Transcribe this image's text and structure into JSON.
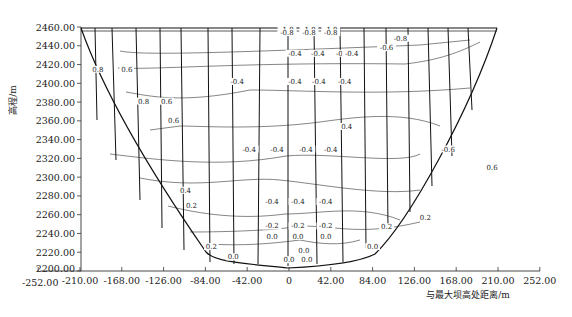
{
  "chart_data": {
    "type": "contour",
    "title": "",
    "xlabel": "与最大坝高处距离/m",
    "ylabel": "高程/m",
    "xlim": [
      -252,
      252
    ],
    "ylim": [
      2200,
      2460
    ],
    "x_ticks": [
      "-252.00",
      "-210.00",
      "-168.00",
      "-126.00",
      "-84.00",
      "-42.00",
      "0",
      "42.00",
      "84.00",
      "126.00",
      "168.00",
      "210.00",
      "252.00"
    ],
    "x_tick_values": [
      -252,
      -210,
      -168,
      -126,
      -84,
      -42,
      0,
      42,
      84,
      126,
      168,
      210,
      252
    ],
    "y_ticks": [
      "2200.00",
      "2220.00",
      "2240.00",
      "2260.00",
      "2280.00",
      "2300.00",
      "2320.00",
      "2340.00",
      "2360.00",
      "2380.00",
      "2400.00",
      "2420.00",
      "2440.00",
      "2460.00"
    ],
    "y_tick_values": [
      2200,
      2220,
      2240,
      2260,
      2280,
      2300,
      2320,
      2340,
      2360,
      2380,
      2400,
      2420,
      2440,
      2460
    ],
    "grid": false,
    "legend": null,
    "dam_outline": [
      [
        -210,
        2458
      ],
      [
        -84,
        2221
      ],
      [
        -42,
        2215
      ],
      [
        0,
        2211
      ],
      [
        42,
        2213
      ],
      [
        84,
        2221
      ],
      [
        210,
        2458
      ]
    ],
    "contour_levels": [
      -1.0,
      -0.8,
      -0.6,
      -0.4,
      -0.2,
      0.0,
      0.2,
      0.4,
      0.6,
      0.8
    ],
    "contour_labels": [
      {
        "text": "-1.0",
        "x": -2,
        "y": 2457
      },
      {
        "text": "-0.8",
        "x": -2,
        "y": 2454
      },
      {
        "text": "-1.0",
        "x": 20,
        "y": 2457
      },
      {
        "text": "-0.8",
        "x": 20,
        "y": 2454
      },
      {
        "text": "-1.0",
        "x": 42,
        "y": 2457
      },
      {
        "text": "-0.8",
        "x": 42,
        "y": 2454
      },
      {
        "text": "-0.6",
        "x": 98,
        "y": 2438
      },
      {
        "text": "-0.8",
        "x": 112,
        "y": 2448
      },
      {
        "text": "-0.4",
        "x": 6,
        "y": 2432
      },
      {
        "text": "-0.4",
        "x": 29,
        "y": 2432
      },
      {
        "text": "-0.4",
        "x": 54,
        "y": 2432
      },
      {
        "text": "-0.4",
        "x": 63,
        "y": 2432
      },
      {
        "text": "-0.4",
        "x": -52,
        "y": 2402
      },
      {
        "text": "-0.4",
        "x": 6,
        "y": 2402
      },
      {
        "text": "-0.4",
        "x": 30,
        "y": 2402
      },
      {
        "text": "-0.4",
        "x": 56,
        "y": 2402
      },
      {
        "text": "0.8",
        "x": -192,
        "y": 2415
      },
      {
        "text": "0.6",
        "x": -163,
        "y": 2415
      },
      {
        "text": "0.6",
        "x": -123,
        "y": 2381
      },
      {
        "text": "0.8",
        "x": -146,
        "y": 2381
      },
      {
        "text": "0.6",
        "x": -116,
        "y": 2360
      },
      {
        "text": "-0.4",
        "x": -40,
        "y": 2330
      },
      {
        "text": "-0.4",
        "x": -12,
        "y": 2330
      },
      {
        "text": "-0.4",
        "x": 17,
        "y": 2330
      },
      {
        "text": "-0.4",
        "x": 42,
        "y": 2330
      },
      {
        "text": "0.4",
        "x": 58,
        "y": 2354
      },
      {
        "text": "-0.6",
        "x": 160,
        "y": 2330
      },
      {
        "text": "0.6",
        "x": 204,
        "y": 2310
      },
      {
        "text": "0.4",
        "x": -104,
        "y": 2286
      },
      {
        "text": "0.2",
        "x": -98,
        "y": 2270
      },
      {
        "text": "-0.4",
        "x": -17,
        "y": 2274
      },
      {
        "text": "-0.4",
        "x": 9,
        "y": 2274
      },
      {
        "text": "-0.4",
        "x": 37,
        "y": 2274
      },
      {
        "text": "-0.2",
        "x": -17,
        "y": 2248
      },
      {
        "text": "-0.2",
        "x": 9,
        "y": 2248
      },
      {
        "text": "-0.2",
        "x": 37,
        "y": 2248
      },
      {
        "text": "0.0",
        "x": -17,
        "y": 2237
      },
      {
        "text": "0.0",
        "x": 9,
        "y": 2237
      },
      {
        "text": "0.0",
        "x": 37,
        "y": 2237
      },
      {
        "text": "0.2",
        "x": 98,
        "y": 2247
      },
      {
        "text": "0.2",
        "x": 137,
        "y": 2257
      },
      {
        "text": "0.2",
        "x": -78,
        "y": 2226
      },
      {
        "text": "0.0",
        "x": -56,
        "y": 2215
      },
      {
        "text": "0.0",
        "x": 0,
        "y": 2212
      },
      {
        "text": "0.0",
        "x": 18,
        "y": 2212
      },
      {
        "text": "0.0",
        "x": 15,
        "y": 2222
      },
      {
        "text": "0.0",
        "x": 84,
        "y": 2226
      }
    ],
    "n_vertical_section_lines": 13
  }
}
